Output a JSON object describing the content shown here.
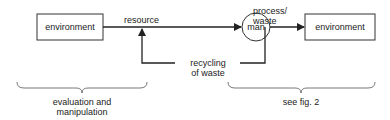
{
  "diagram": {
    "nodes": {
      "env_left": "environment",
      "man": "man",
      "env_right": "environment"
    },
    "edges": {
      "resource": "resource",
      "process_waste_1": "process/",
      "process_waste_2": "waste",
      "recycling_1": "recycling",
      "recycling_2": "of waste"
    },
    "braces": {
      "left_1": "evaluation and",
      "left_2": "manipulation",
      "right": "see fig. 2"
    }
  }
}
